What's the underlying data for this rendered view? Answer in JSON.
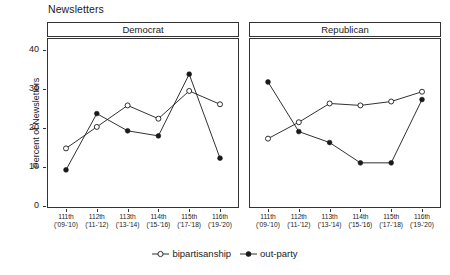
{
  "chart_data": {
    "type": "line",
    "title": "Newsletters",
    "xlabel": "",
    "ylabel": "Percent of Newsletters",
    "ylim": [
      0,
      43
    ],
    "yticks": [
      0,
      10,
      20,
      30,
      40
    ],
    "ytick_labels": [
      "0",
      "10",
      "20",
      "30",
      "40"
    ],
    "grid": false,
    "legend_position": "bottom",
    "categories": [
      "111th",
      "112th",
      "113th",
      "114th",
      "115th",
      "116th"
    ],
    "category_sublabels": [
      "('09-'10)",
      "('11-'12)",
      "('13-'14)",
      "('15-'16)",
      "('17-'18)",
      "('19-'20)"
    ],
    "panels": [
      {
        "label": "Democrat",
        "series": [
          {
            "name": "bipartisanship",
            "marker": "open-circle",
            "values": [
              15.0,
              20.5,
              26.0,
              22.6,
              29.7,
              26.3
            ]
          },
          {
            "name": "out-party",
            "marker": "filled-circle",
            "values": [
              9.5,
              23.9,
              19.5,
              18.2,
              34.0,
              12.5
            ]
          }
        ]
      },
      {
        "label": "Republican",
        "series": [
          {
            "name": "bipartisanship",
            "marker": "open-circle",
            "values": [
              17.5,
              21.7,
              26.5,
              26.0,
              27.0,
              29.5
            ]
          },
          {
            "name": "out-party",
            "marker": "filled-circle",
            "values": [
              32.0,
              19.3,
              16.5,
              11.3,
              11.3,
              27.5
            ]
          }
        ]
      }
    ],
    "legend": [
      {
        "label": "bipartisanship",
        "marker": "open-circle"
      },
      {
        "label": "out-party",
        "marker": "filled-circle"
      }
    ],
    "colors": {
      "line": "#1a1a1a",
      "axis": "#333333",
      "background": "#ffffff"
    }
  }
}
